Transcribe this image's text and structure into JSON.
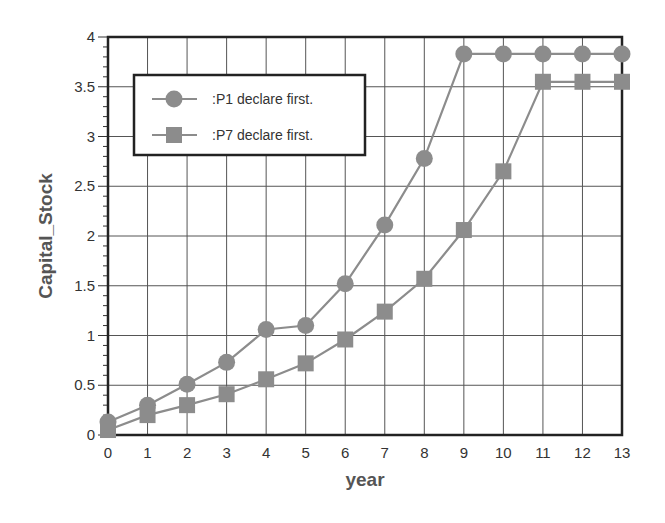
{
  "chart_data": {
    "type": "line",
    "title": "",
    "xlabel": "year",
    "ylabel": "Capital_Stock",
    "x": [
      0,
      1,
      2,
      3,
      4,
      5,
      6,
      7,
      8,
      9,
      10,
      11,
      12,
      13
    ],
    "xlim": [
      0,
      13
    ],
    "ylim": [
      0,
      4
    ],
    "xticks": [
      "0",
      "1",
      "2",
      "3",
      "4",
      "5",
      "6",
      "7",
      "8",
      "9",
      "10",
      "11",
      "12",
      "13"
    ],
    "yticks": [
      "0",
      "0.5",
      "1",
      "1.5",
      "2",
      "2.5",
      "3",
      "3.5",
      "4"
    ],
    "grid": true,
    "legend_position": "upper-left",
    "series": [
      {
        "name": ":P1 declare first.",
        "marker": "circle",
        "color": "#8c8c8c",
        "values": [
          0.13,
          0.3,
          0.51,
          0.73,
          1.06,
          1.1,
          1.52,
          2.11,
          2.78,
          3.83,
          3.83,
          3.83,
          3.83,
          3.83
        ]
      },
      {
        "name": ":P7 declare first.",
        "marker": "square",
        "color": "#8c8c8c",
        "values": [
          0.05,
          0.2,
          0.3,
          0.41,
          0.56,
          0.72,
          0.96,
          1.24,
          1.57,
          2.06,
          2.65,
          3.55,
          3.55,
          3.55
        ]
      }
    ]
  }
}
